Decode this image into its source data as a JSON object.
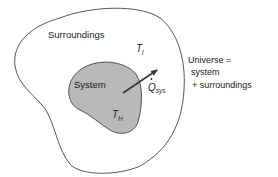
{
  "diagram": {
    "type": "thermodynamic-system-boundary",
    "regions": {
      "surroundings": {
        "label": "Surroundings",
        "temperature_symbol": "T",
        "temperature_subscript": "l"
      },
      "system": {
        "label": "System",
        "temperature_symbol": "T",
        "temperature_subscript": "H",
        "fill": "#b9b9b9"
      }
    },
    "heat_flow": {
      "symbol": "Q",
      "dot": "˙",
      "subscript": "sys",
      "direction": "system-to-surroundings"
    },
    "universe_note": {
      "line1": "Universe =",
      "line2": "system",
      "line3": "+ surroundings"
    },
    "colors": {
      "outline": "#444444",
      "system_fill": "#b9b9b9",
      "text": "#222222",
      "arrow": "#333333"
    }
  }
}
